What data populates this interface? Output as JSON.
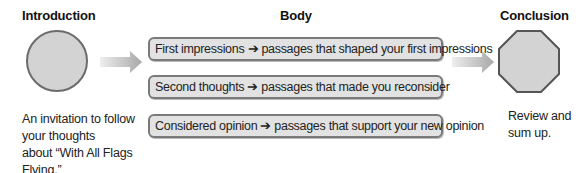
{
  "columns": {
    "introduction": {
      "heading": "Introduction",
      "shape": "circle",
      "description_lines": [
        "An invitation to follow",
        "your thoughts",
        "about “With All Flags",
        "Flying.”"
      ]
    },
    "body": {
      "heading": "Body",
      "items": [
        {
          "label": "First impressions ➔ passages that shaped your first impressions"
        },
        {
          "label": "Second thoughts ➔ passages that made you reconsider"
        },
        {
          "label": "Considered opinion ➔ passages that support your new opinion"
        }
      ]
    },
    "conclusion": {
      "heading": "Conclusion",
      "shape": "octagon",
      "description_lines": [
        "Review and",
        "sum up."
      ]
    }
  },
  "colors": {
    "shape_fill": "#d3d3d3",
    "shape_border": "#6b6b6b",
    "box_fill": "#e2e2e2",
    "arrow": "#b5b5b5"
  }
}
